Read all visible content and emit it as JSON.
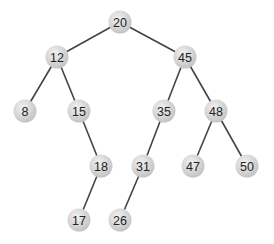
{
  "diagram": {
    "type": "binary-search-tree",
    "style": {
      "background": "#ffffff",
      "node_fill_light": "#f2f2f2",
      "node_fill_dark": "#c4c4c4",
      "edge_color": "#444444",
      "text_color": "#222222",
      "node_radius": 11.5
    },
    "nodes": [
      {
        "id": "n20",
        "label": "20",
        "x": 120,
        "y": 22
      },
      {
        "id": "n12",
        "label": "12",
        "x": 57,
        "y": 57
      },
      {
        "id": "n45",
        "label": "45",
        "x": 185,
        "y": 57
      },
      {
        "id": "n8",
        "label": "8",
        "x": 25,
        "y": 111
      },
      {
        "id": "n15",
        "label": "15",
        "x": 79,
        "y": 111
      },
      {
        "id": "n35",
        "label": "35",
        "x": 164,
        "y": 111
      },
      {
        "id": "n48",
        "label": "48",
        "x": 216,
        "y": 111
      },
      {
        "id": "n18",
        "label": "18",
        "x": 101,
        "y": 166
      },
      {
        "id": "n31",
        "label": "31",
        "x": 143,
        "y": 166
      },
      {
        "id": "n47",
        "label": "47",
        "x": 193,
        "y": 166
      },
      {
        "id": "n50",
        "label": "50",
        "x": 247,
        "y": 166
      },
      {
        "id": "n17",
        "label": "17",
        "x": 79,
        "y": 220
      },
      {
        "id": "n26",
        "label": "26",
        "x": 120,
        "y": 220
      }
    ],
    "edges": [
      {
        "from": "n20",
        "to": "n12"
      },
      {
        "from": "n20",
        "to": "n45"
      },
      {
        "from": "n12",
        "to": "n8"
      },
      {
        "from": "n12",
        "to": "n15"
      },
      {
        "from": "n45",
        "to": "n35"
      },
      {
        "from": "n45",
        "to": "n48"
      },
      {
        "from": "n15",
        "to": "n18"
      },
      {
        "from": "n35",
        "to": "n31"
      },
      {
        "from": "n48",
        "to": "n47"
      },
      {
        "from": "n48",
        "to": "n50"
      },
      {
        "from": "n18",
        "to": "n17"
      },
      {
        "from": "n31",
        "to": "n26"
      }
    ]
  }
}
